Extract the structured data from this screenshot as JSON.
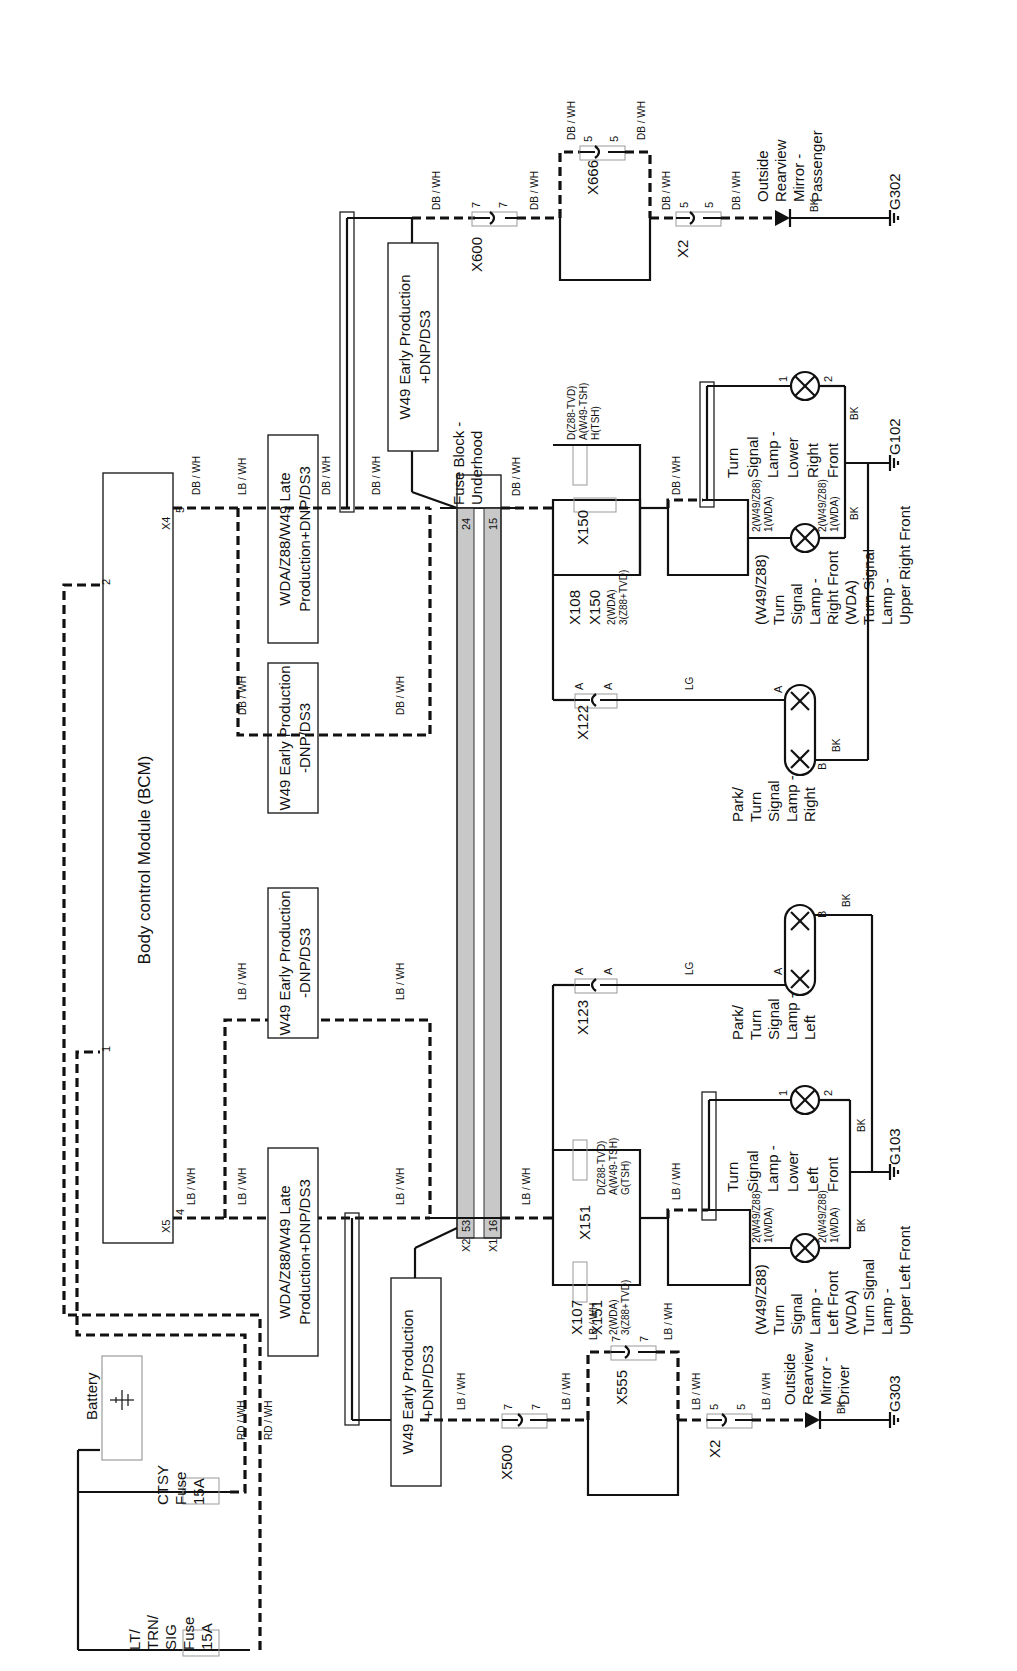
{
  "diagram": {
    "type": "wiring-schematic",
    "orientation": "rotated-90",
    "modules": {
      "bcm": {
        "label": "Body control Module (BCM)",
        "pin1": "1",
        "pin2": "2",
        "x5_label": "X5",
        "x5_pin": "4",
        "x4_label": "X4",
        "x4_pin": "5"
      },
      "battery": {
        "label": "Battery"
      },
      "fuse_lt": {
        "line1": "LT/",
        "line2": "TRN/",
        "line3": "SIG",
        "line4": "Fuse",
        "line5": "15A"
      },
      "fuse_ctsy": {
        "line1": "CTSY",
        "line2": "Fuse",
        "line3": "15A"
      },
      "fuse_block": {
        "line1": "Fuse Block -",
        "line2": "Underhood",
        "pin24": "24",
        "pin15": "15",
        "x2_label": "X2",
        "pin53": "53",
        "x1_label": "X1",
        "pin16": "16"
      }
    },
    "option_boxes": [
      {
        "id": "late-left",
        "line1": "WDA/Z88/W49 Late",
        "line2": "Production+DNP/DS3"
      },
      {
        "id": "early-minus-left",
        "line1": "W49 Early Production",
        "line2": "-DNP/DS3"
      },
      {
        "id": "early-minus-right",
        "line1": "W49 Early Production",
        "line2": "-DNP/DS3"
      },
      {
        "id": "late-right",
        "line1": "WDA/Z88/W49 Late",
        "line2": "Production+DNP/DS3"
      },
      {
        "id": "early-plus-right",
        "line1": "W49 Early Production",
        "line2": "+DNP/DS3"
      },
      {
        "id": "early-plus-left",
        "line1": "W49 Early Production",
        "line2": "+DNP/DS3"
      }
    ],
    "wire_colors": {
      "rd_wh": "RD / WH",
      "lb_wh": "LB / WH",
      "db_wh": "DB / WH",
      "lg": "LG",
      "bk": "BK"
    },
    "connectors": {
      "x600": {
        "label": "X600",
        "pin": "7"
      },
      "x666": {
        "label": "X666",
        "pin": "5"
      },
      "x2_right": {
        "label": "X2",
        "pin": "5"
      },
      "x500": {
        "label": "X500",
        "pin": "7"
      },
      "x555": {
        "label": "X555",
        "pin": "7"
      },
      "x2_left": {
        "label": "X2",
        "pin": "5"
      },
      "x150": {
        "label": "X150",
        "top1": "D(Z88-TVD)",
        "top2": "A(W49-TSH)",
        "top3": "H(TSH)"
      },
      "x108": {
        "label1": "X108",
        "label2": "X150",
        "sub1": "2(WDA)",
        "sub2": "3(Z88+TVD)"
      },
      "x151": {
        "label": "X151",
        "top1": "D(Z88-TVD)",
        "top2": "A(W49-TSH)",
        "top3": "G(TSH)"
      },
      "x107": {
        "label1": "X107",
        "label2": "X151",
        "sub1": "2(WDA)",
        "sub2": "3(Z88+TVD)"
      },
      "x122": {
        "label": "X122",
        "pin": "A"
      },
      "x123": {
        "label": "X123",
        "pin": "A"
      }
    },
    "lamps": {
      "mirror_passenger": {
        "line1": "Outside",
        "line2": "Rearview",
        "line3": "Mirror -",
        "line4": "Passenger"
      },
      "mirror_driver": {
        "line1": "Outside",
        "line2": "Rearview",
        "line3": "Mirror -",
        "line4": "Driver"
      },
      "tsl_lower_right": {
        "line1": "Turn",
        "line2": "Signal",
        "line3": "Lamp -",
        "line4": "Lower",
        "line5": "Right",
        "line6": "Front",
        "pin1": "1",
        "pin2": "2"
      },
      "tsl_right_front": {
        "line1": "(W49/Z88)",
        "line2": "Turn",
        "line3": "Signal",
        "line4": "Lamp -",
        "line5": "Right Front",
        "line6": "(WDA)",
        "line7": "Turn Signal",
        "line8": "Lamp -",
        "line9": "Upper Right Front",
        "pinA": "2(W49/Z88)",
        "pinB": "1(WDA)"
      },
      "park_right": {
        "line1": "Park/",
        "line2": "Turn",
        "line3": "Signal",
        "line4": "Lamp -",
        "line5": "Right",
        "pinA": "A",
        "pinB": "B"
      },
      "park_left": {
        "line1": "Park/",
        "line2": "Turn",
        "line3": "Signal",
        "line4": "Lamp -",
        "line5": "Left",
        "pinA": "A",
        "pinB": "B"
      },
      "tsl_lower_left": {
        "line1": "Turn",
        "line2": "Signal",
        "line3": "Lamp -",
        "line4": "Lower",
        "line5": "Left",
        "line6": "Front",
        "pin1": "1",
        "pin2": "2"
      },
      "tsl_left_front": {
        "line1": "(W49/Z88)",
        "line2": "Turn",
        "line3": "Signal",
        "line4": "Lamp -",
        "line5": "Left Front",
        "line6": "(WDA)",
        "line7": "Turn Signal",
        "line8": "Lamp -",
        "line9": "Upper Left Front",
        "pinA": "2(W49/Z88)",
        "pinB": "1(WDA)"
      }
    },
    "grounds": {
      "g302": "G302",
      "g102": "G102",
      "g103": "G103",
      "g303": "G303"
    }
  }
}
